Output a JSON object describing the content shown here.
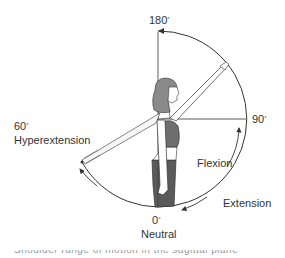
{
  "diagram": {
    "title": "Shoulder range of motion in the sagittal plane",
    "labels": {
      "top_angle": "180",
      "right_angle": "90",
      "left_angle": "60",
      "left_label": "Hyperextension",
      "flexion": "Flexion",
      "extension": "Extension",
      "bottom_angle": "0",
      "bottom_label": "Neutral",
      "degree_symbol": "°"
    },
    "caption": "Shoulder range of motion in the sagittal plane",
    "colors": {
      "line": "#333333",
      "hair": "#8a8a8a",
      "top": "#6e6e6e",
      "pants": "#5a5a5a",
      "skin": "#ffffff"
    }
  }
}
